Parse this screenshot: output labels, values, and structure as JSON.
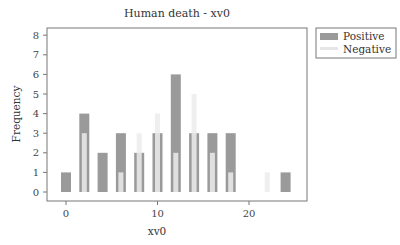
{
  "chart_data": {
    "type": "bar",
    "title": "Human death - xv0",
    "xlabel": "xv0",
    "ylabel": "Frequency",
    "xlim": [
      -2,
      26.5
    ],
    "ylim": [
      -0.4,
      8.3
    ],
    "x_ticks": [
      0,
      10,
      20
    ],
    "y_ticks": [
      0,
      1,
      2,
      3,
      4,
      5,
      6,
      7,
      8
    ],
    "grid": false,
    "legend_position": "right-top-outside",
    "series": [
      {
        "name": "Positive",
        "color": "#9a9a9a",
        "x": [
          0,
          2,
          4,
          6,
          8,
          10,
          12,
          14,
          16,
          18,
          24
        ],
        "values": [
          1,
          4,
          2,
          3,
          2,
          3,
          6,
          3,
          3,
          3,
          1
        ]
      },
      {
        "name": "Negative",
        "color": "#ececec",
        "x": [
          2,
          6,
          8,
          10,
          12,
          14,
          16,
          18,
          22
        ],
        "values": [
          3,
          1,
          3,
          4,
          2,
          5,
          2,
          1,
          1
        ]
      }
    ]
  },
  "legend": {
    "items": [
      {
        "label": "Positive",
        "color": "#9a9a9a"
      },
      {
        "label": "Negative",
        "color": "#ececec"
      }
    ]
  }
}
